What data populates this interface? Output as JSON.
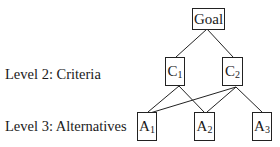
{
  "diagram": {
    "type": "hierarchy",
    "levels": [
      {
        "label": "Level 2: Criteria"
      },
      {
        "label": "Level 3: Alternatives"
      }
    ],
    "nodes": {
      "goal": {
        "text": "Goal"
      },
      "c1": {
        "base": "C",
        "sub": "1"
      },
      "c2": {
        "base": "C",
        "sub": "2"
      },
      "a1": {
        "base": "A",
        "sub": "1"
      },
      "a2": {
        "base": "A",
        "sub": "2"
      },
      "a3": {
        "base": "A",
        "sub": "3"
      }
    },
    "edges": [
      [
        "Goal",
        "C1"
      ],
      [
        "Goal",
        "C2"
      ],
      [
        "C1",
        "A1"
      ],
      [
        "C1",
        "A2"
      ],
      [
        "C2",
        "A1"
      ],
      [
        "C2",
        "A2"
      ],
      [
        "C2",
        "A3"
      ]
    ]
  }
}
